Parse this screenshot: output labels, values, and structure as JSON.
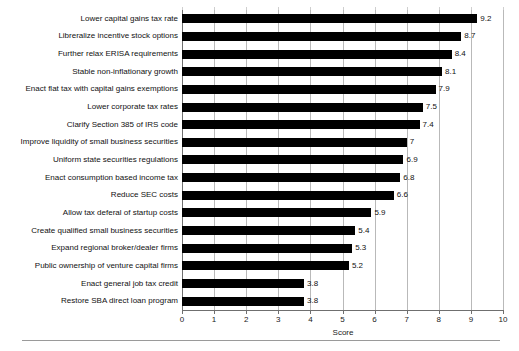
{
  "chart_data": {
    "type": "bar",
    "orientation": "horizontal",
    "title": "",
    "xlabel": "Score",
    "ylabel": "",
    "xlim": [
      0,
      10
    ],
    "grid": true,
    "legend": false,
    "xticks": [
      "0",
      "1",
      "2",
      "3",
      "4",
      "5",
      "6",
      "7",
      "8",
      "9",
      "10"
    ],
    "categories": [
      "Lower capital gains tax rate",
      "Libreralize incentive stock options",
      "Further relax ERISA requirements",
      "Stable non-inflationary growth",
      "Enact flat tax with capital gains exemptions",
      "Lower corporate tax rates",
      "Clarify Section 385 of IRS code",
      "Improve liquidity of small business securities",
      "Uniform state securities regulations",
      "Enact consumption based income tax",
      "Reduce SEC costs",
      "Allow tax deferal of startup costs",
      "Create qualified small business securities",
      "Expand regional broker/dealer firms",
      "Public ownership of venture capital firms",
      "Enact general job tax credit",
      "Restore SBA direct loan program"
    ],
    "values": [
      9.2,
      8.7,
      8.4,
      8.1,
      7.9,
      7.5,
      7.4,
      7,
      6.9,
      6.8,
      6.6,
      5.9,
      5.4,
      5.3,
      5.2,
      3.8,
      3.8
    ],
    "value_labels": [
      "9.2",
      "8.7",
      "8.4",
      "8.1",
      "7.9",
      "7.5",
      "7.4",
      "7",
      "6.9",
      "6.8",
      "6.6",
      "5.9",
      "5.4",
      "5.3",
      "5.2",
      "3.8",
      "3.8"
    ],
    "bar_color": "#000000",
    "grid_color": "#b9b9b9",
    "axis_color": "#6f6f6f"
  }
}
